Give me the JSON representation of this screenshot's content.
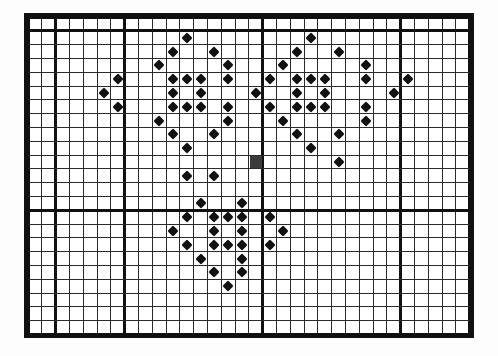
{
  "document": {
    "title": "Cross-stitch Pattern Chart",
    "type": "counted cross-stitch grid chart",
    "background_color": "#ffffff",
    "ink_color": "#111111"
  },
  "grid": {
    "columns": 32,
    "rows": 23,
    "cell_size_px": 13.8,
    "origin_x_px": 28,
    "origin_y_px": 17,
    "minor_line_width_px": 1,
    "major_line_width_px": 3,
    "major_every_columns": [
      0,
      2,
      7,
      17,
      27,
      32
    ],
    "major_every_rows": [
      0,
      1,
      14,
      23
    ],
    "outer_border_width_px": 4,
    "minor_line_color": "#2a2a2a",
    "major_line_color": "#111111",
    "border_color": "#111111"
  },
  "symbols": {
    "legend": [
      {
        "key": "diamond",
        "name": "diamond-symbol",
        "glyph": "◆",
        "color": "#111111",
        "size_px": 8
      },
      {
        "key": "block",
        "name": "solid-block-symbol",
        "glyph": "■",
        "color": "#3a3a3a",
        "size_px": 12
      }
    ]
  },
  "chart_data": {
    "type": "heatmap",
    "subtitle": "",
    "xlabel": "",
    "ylabel": "",
    "grid": true,
    "legend_position": "none",
    "axis_x_range": [
      0,
      32
    ],
    "axis_y_range": [
      0,
      23
    ],
    "categories_x": [
      0,
      1,
      2,
      3,
      4,
      5,
      6,
      7,
      8,
      9,
      10,
      11,
      12,
      13,
      14,
      15,
      16,
      17,
      18,
      19,
      20,
      21,
      22,
      23,
      24,
      25,
      26,
      27,
      28,
      29,
      30,
      31
    ],
    "categories_y": [
      0,
      1,
      2,
      3,
      4,
      5,
      6,
      7,
      8,
      9,
      10,
      11,
      12,
      13,
      14,
      15,
      16,
      17,
      18,
      19,
      20,
      21,
      22
    ],
    "stitch_count_diamond": 86,
    "stitch_count_block": 1,
    "points": [
      {
        "col": 11,
        "row": 1,
        "sym": "diamond"
      },
      {
        "col": 20,
        "row": 1,
        "sym": "diamond"
      },
      {
        "col": 10,
        "row": 2,
        "sym": "diamond"
      },
      {
        "col": 13,
        "row": 2,
        "sym": "diamond"
      },
      {
        "col": 19,
        "row": 2,
        "sym": "diamond"
      },
      {
        "col": 22,
        "row": 2,
        "sym": "diamond"
      },
      {
        "col": 9,
        "row": 3,
        "sym": "diamond"
      },
      {
        "col": 14,
        "row": 3,
        "sym": "diamond"
      },
      {
        "col": 18,
        "row": 3,
        "sym": "diamond"
      },
      {
        "col": 24,
        "row": 3,
        "sym": "diamond"
      },
      {
        "col": 6,
        "row": 4,
        "sym": "diamond"
      },
      {
        "col": 10,
        "row": 4,
        "sym": "diamond"
      },
      {
        "col": 11,
        "row": 4,
        "sym": "diamond"
      },
      {
        "col": 12,
        "row": 4,
        "sym": "diamond"
      },
      {
        "col": 14,
        "row": 4,
        "sym": "diamond"
      },
      {
        "col": 17,
        "row": 4,
        "sym": "diamond"
      },
      {
        "col": 19,
        "row": 4,
        "sym": "diamond"
      },
      {
        "col": 20,
        "row": 4,
        "sym": "diamond"
      },
      {
        "col": 21,
        "row": 4,
        "sym": "diamond"
      },
      {
        "col": 24,
        "row": 4,
        "sym": "diamond"
      },
      {
        "col": 27,
        "row": 4,
        "sym": "diamond"
      },
      {
        "col": 5,
        "row": 5,
        "sym": "diamond"
      },
      {
        "col": 10,
        "row": 5,
        "sym": "diamond"
      },
      {
        "col": 12,
        "row": 5,
        "sym": "diamond"
      },
      {
        "col": 16,
        "row": 5,
        "sym": "diamond"
      },
      {
        "col": 19,
        "row": 5,
        "sym": "diamond"
      },
      {
        "col": 21,
        "row": 5,
        "sym": "diamond"
      },
      {
        "col": 26,
        "row": 5,
        "sym": "diamond"
      },
      {
        "col": 6,
        "row": 6,
        "sym": "diamond"
      },
      {
        "col": 10,
        "row": 6,
        "sym": "diamond"
      },
      {
        "col": 11,
        "row": 6,
        "sym": "diamond"
      },
      {
        "col": 12,
        "row": 6,
        "sym": "diamond"
      },
      {
        "col": 14,
        "row": 6,
        "sym": "diamond"
      },
      {
        "col": 17,
        "row": 6,
        "sym": "diamond"
      },
      {
        "col": 19,
        "row": 6,
        "sym": "diamond"
      },
      {
        "col": 20,
        "row": 6,
        "sym": "diamond"
      },
      {
        "col": 21,
        "row": 6,
        "sym": "diamond"
      },
      {
        "col": 24,
        "row": 6,
        "sym": "diamond"
      },
      {
        "col": 9,
        "row": 7,
        "sym": "diamond"
      },
      {
        "col": 14,
        "row": 7,
        "sym": "diamond"
      },
      {
        "col": 18,
        "row": 7,
        "sym": "diamond"
      },
      {
        "col": 24,
        "row": 7,
        "sym": "diamond"
      },
      {
        "col": 10,
        "row": 8,
        "sym": "diamond"
      },
      {
        "col": 13,
        "row": 8,
        "sym": "diamond"
      },
      {
        "col": 19,
        "row": 8,
        "sym": "diamond"
      },
      {
        "col": 22,
        "row": 8,
        "sym": "diamond"
      },
      {
        "col": 11,
        "row": 9,
        "sym": "diamond"
      },
      {
        "col": 20,
        "row": 9,
        "sym": "diamond"
      },
      {
        "col": 16,
        "row": 10,
        "sym": "block"
      },
      {
        "col": 22,
        "row": 10,
        "sym": "diamond"
      },
      {
        "col": 11,
        "row": 11,
        "sym": "diamond"
      },
      {
        "col": 13,
        "row": 11,
        "sym": "diamond"
      },
      {
        "col": 12,
        "row": 13,
        "sym": "diamond"
      },
      {
        "col": 15,
        "row": 13,
        "sym": "diamond"
      },
      {
        "col": 11,
        "row": 14,
        "sym": "diamond"
      },
      {
        "col": 13,
        "row": 14,
        "sym": "diamond"
      },
      {
        "col": 14,
        "row": 14,
        "sym": "diamond"
      },
      {
        "col": 15,
        "row": 14,
        "sym": "diamond"
      },
      {
        "col": 17,
        "row": 14,
        "sym": "diamond"
      },
      {
        "col": 10,
        "row": 15,
        "sym": "diamond"
      },
      {
        "col": 13,
        "row": 15,
        "sym": "diamond"
      },
      {
        "col": 15,
        "row": 15,
        "sym": "diamond"
      },
      {
        "col": 18,
        "row": 15,
        "sym": "diamond"
      },
      {
        "col": 11,
        "row": 16,
        "sym": "diamond"
      },
      {
        "col": 13,
        "row": 16,
        "sym": "diamond"
      },
      {
        "col": 14,
        "row": 16,
        "sym": "diamond"
      },
      {
        "col": 15,
        "row": 16,
        "sym": "diamond"
      },
      {
        "col": 17,
        "row": 16,
        "sym": "diamond"
      },
      {
        "col": 12,
        "row": 17,
        "sym": "diamond"
      },
      {
        "col": 15,
        "row": 17,
        "sym": "diamond"
      },
      {
        "col": 13,
        "row": 18,
        "sym": "diamond"
      },
      {
        "col": 15,
        "row": 18,
        "sym": "diamond"
      },
      {
        "col": 14,
        "row": 19,
        "sym": "diamond"
      }
    ]
  }
}
